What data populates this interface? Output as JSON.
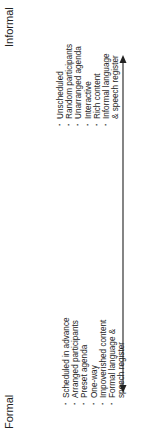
{
  "diagram": {
    "orientation": "rotated-90-ccw",
    "left_pole": {
      "label": "Formal"
    },
    "right_pole": {
      "label": "Informal"
    },
    "arrow": {
      "type": "double-headed",
      "color": "#333333"
    },
    "formal_items": [
      "Scheduled in advance",
      "Arranged participants",
      "Preset agenda",
      "One-way",
      "Impoverished content",
      "Formal language &",
      "speech register"
    ],
    "informal_items": [
      "Unscheduled",
      "Random participants",
      "Unarranged agenda",
      "Interactive",
      "Rich content",
      "Informal language",
      "& speech register"
    ]
  }
}
